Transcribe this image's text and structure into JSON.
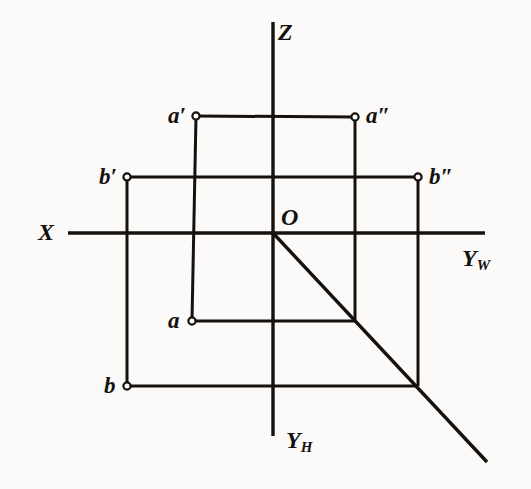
{
  "figure": {
    "type": "descriptive-geometry-projection",
    "background_color": "#fbfaf8",
    "line_color": "#14110f",
    "canvas": {
      "width": 531,
      "height": 489
    }
  },
  "axes": {
    "z": {
      "label": "Z",
      "label_x": 278,
      "label_y": 20,
      "x1": 273,
      "y1": 22,
      "x2": 273,
      "y2": 436
    },
    "x": {
      "label": "X",
      "label_x": 38,
      "label_y": 220,
      "x1": 68,
      "y1": 233,
      "x2": 485,
      "y2": 233
    },
    "y_w": {
      "label": "Y",
      "subscript": "W",
      "label_x": 462,
      "label_y": 246
    },
    "y_h": {
      "label": "Y",
      "subscript": "H",
      "label_x": 286,
      "label_y": 428
    },
    "origin": {
      "label": "O",
      "x": 273,
      "y": 233,
      "label_x": 281,
      "label_y": 205
    }
  },
  "bisector": {
    "name": "45-degree-bisector",
    "x1": 273,
    "y1": 233,
    "x2": 487,
    "y2": 462
  },
  "points": [
    {
      "id": "a-prime",
      "label": "a",
      "prime": "′",
      "x": 196,
      "y": 116,
      "label_x": 168,
      "label_y": 104,
      "marker": "open-circle",
      "projection": "frontal (V) projection of A"
    },
    {
      "id": "a-double-prime",
      "label": "a",
      "prime": "″",
      "x": 355,
      "y": 117,
      "label_x": 366,
      "label_y": 104,
      "marker": "open-circle",
      "projection": "profile (W) projection of A"
    },
    {
      "id": "b-prime",
      "label": "b",
      "prime": "′",
      "x": 127,
      "y": 177,
      "label_x": 99,
      "label_y": 165,
      "marker": "open-circle",
      "projection": "frontal (V) projection of B"
    },
    {
      "id": "b-double-prime",
      "label": "b",
      "prime": "″",
      "x": 418,
      "y": 177,
      "label_x": 429,
      "label_y": 165,
      "marker": "open-circle",
      "projection": "profile (W) projection of B"
    },
    {
      "id": "a-plain",
      "label": "a",
      "prime": "",
      "x": 192,
      "y": 321,
      "label_x": 168,
      "label_y": 309,
      "marker": "open-circle",
      "projection": "horizontal (H) projection of A"
    },
    {
      "id": "b-plain",
      "label": "b",
      "prime": "",
      "x": 127,
      "y": 386,
      "label_x": 104,
      "label_y": 374,
      "marker": "open-circle",
      "projection": "horizontal (H) projection of B"
    }
  ],
  "projection_lines": [
    {
      "name": "a-prime-to-a-double-prime-horizontal",
      "x1": 196,
      "y1": 116,
      "x2": 355,
      "y2": 117
    },
    {
      "name": "b-prime-to-b-double-prime-horizontal",
      "x1": 127,
      "y1": 177,
      "x2": 418,
      "y2": 177
    },
    {
      "name": "a-prime-to-a-vertical",
      "x1": 196,
      "y1": 116,
      "x2": 192,
      "y2": 321
    },
    {
      "name": "b-prime-to-b-vertical",
      "x1": 127,
      "y1": 177,
      "x2": 127,
      "y2": 386
    },
    {
      "name": "a-double-prime-vertical-to-bisector",
      "x1": 355,
      "y1": 117,
      "x2": 355,
      "y2": 321
    },
    {
      "name": "b-double-prime-vertical-to-bisector",
      "x1": 418,
      "y1": 177,
      "x2": 418,
      "y2": 386
    },
    {
      "name": "a-horizontal-to-bisector",
      "x1": 192,
      "y1": 321,
      "x2": 355,
      "y2": 321
    },
    {
      "name": "b-horizontal-to-bisector",
      "x1": 127,
      "y1": 386,
      "x2": 418,
      "y2": 386
    }
  ]
}
